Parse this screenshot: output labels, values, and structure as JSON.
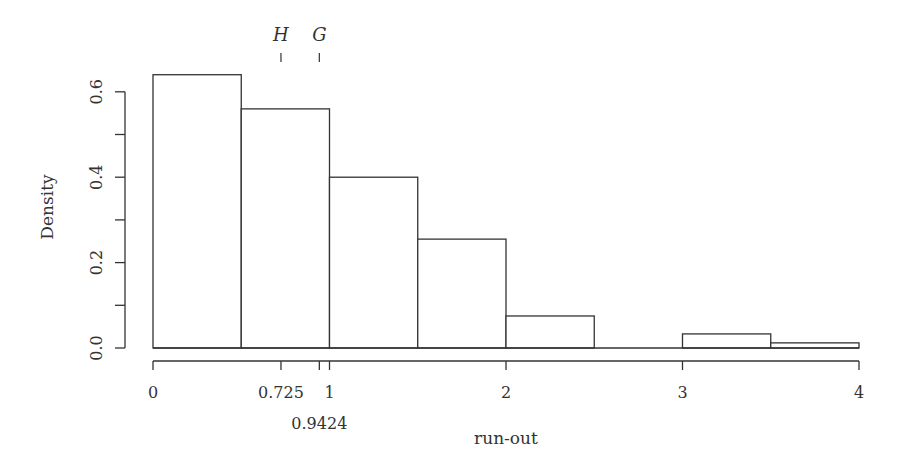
{
  "chart_data": {
    "type": "bar",
    "subtype": "histogram",
    "title": "",
    "xlabel": "run-out",
    "ylabel": "Density",
    "bins": [
      {
        "from": 0.0,
        "to": 0.5,
        "density": 0.64
      },
      {
        "from": 0.5,
        "to": 1.0,
        "density": 0.56
      },
      {
        "from": 1.0,
        "to": 1.5,
        "density": 0.4
      },
      {
        "from": 1.5,
        "to": 2.0,
        "density": 0.255
      },
      {
        "from": 2.0,
        "to": 2.5,
        "density": 0.075
      },
      {
        "from": 2.5,
        "to": 3.0,
        "density": 0.0
      },
      {
        "from": 3.0,
        "to": 3.5,
        "density": 0.033
      },
      {
        "from": 3.5,
        "to": 4.0,
        "density": 0.012
      }
    ],
    "categories": [
      "0-0.5",
      "0.5-1",
      "1-1.5",
      "1.5-2",
      "2-2.5",
      "2.5-3",
      "3-3.5",
      "3.5-4"
    ],
    "values": [
      0.64,
      0.56,
      0.4,
      0.255,
      0.075,
      0.0,
      0.033,
      0.012
    ],
    "xlim": [
      0,
      4
    ],
    "ylim": [
      0,
      0.65
    ],
    "x_ticks": [
      {
        "value": 0,
        "label": "0",
        "row": 0
      },
      {
        "value": 0.725,
        "label": "0.725",
        "row": 0
      },
      {
        "value": 0.9424,
        "label": "0.9424",
        "row": 1
      },
      {
        "value": 1,
        "label": "1",
        "row": 0
      },
      {
        "value": 2,
        "label": "2",
        "row": 0
      },
      {
        "value": 3,
        "label": "3",
        "row": 0
      },
      {
        "value": 4,
        "label": "4",
        "row": 0
      }
    ],
    "y_ticks": [
      {
        "value": 0.0,
        "label": "0.0"
      },
      {
        "value": 0.1,
        "label": ""
      },
      {
        "value": 0.2,
        "label": "0.2"
      },
      {
        "value": 0.3,
        "label": ""
      },
      {
        "value": 0.4,
        "label": "0.4"
      },
      {
        "value": 0.5,
        "label": ""
      },
      {
        "value": 0.6,
        "label": "0.6"
      }
    ],
    "annotations": [
      {
        "label": "H",
        "x": 0.725,
        "position": "top"
      },
      {
        "label": "G",
        "x": 0.9424,
        "position": "top"
      }
    ],
    "grid": false,
    "legend": null
  },
  "colors": {
    "stroke": "#333333",
    "fill": "#ffffff",
    "text": "#333333"
  }
}
